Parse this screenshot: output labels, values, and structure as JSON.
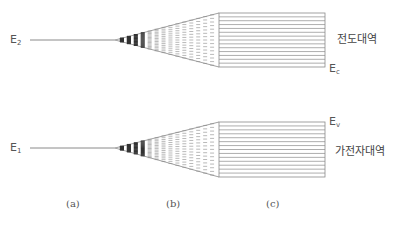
{
  "diagram": {
    "type": "energy-band-formation",
    "levels": [
      {
        "id": "upper",
        "label_main": "E",
        "label_sub": "2"
      },
      {
        "id": "lower",
        "label_main": "E",
        "label_sub": "1"
      }
    ],
    "bands": {
      "conduction": {
        "name": "전도대역",
        "edge_main": "E",
        "edge_sub": "c"
      },
      "valence": {
        "name": "가전자대역",
        "edge_main": "E",
        "edge_sub": "v"
      }
    },
    "panels": [
      {
        "id": "a",
        "label": "(a)"
      },
      {
        "id": "b",
        "label": "(b)"
      },
      {
        "id": "c",
        "label": "(c)"
      }
    ],
    "colors": {
      "line": "#8a8a8a",
      "dark": "#333333",
      "text": "#555555"
    }
  }
}
